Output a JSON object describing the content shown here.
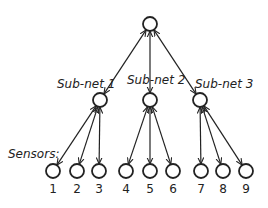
{
  "diagram": {
    "root": {
      "x": 150,
      "y": 24
    },
    "subnets": [
      {
        "label": "Sub-net 1",
        "x": 100,
        "y": 100,
        "lx": 57,
        "ly": 77
      },
      {
        "label": "Sub-net 2",
        "x": 150,
        "y": 100,
        "lx": 127,
        "ly": 73
      },
      {
        "label": "Sub-net 3",
        "x": 200,
        "y": 100,
        "lx": 195,
        "ly": 77
      }
    ],
    "sensors_label": "Sensors:",
    "sensors": [
      {
        "label": "1",
        "x": 53,
        "y": 171,
        "parent": 0
      },
      {
        "label": "2",
        "x": 77,
        "y": 171,
        "parent": 0
      },
      {
        "label": "3",
        "x": 99,
        "y": 171,
        "parent": 0
      },
      {
        "label": "4",
        "x": 126,
        "y": 171,
        "parent": 1
      },
      {
        "label": "5",
        "x": 150,
        "y": 171,
        "parent": 1
      },
      {
        "label": "6",
        "x": 173,
        "y": 171,
        "parent": 1
      },
      {
        "label": "7",
        "x": 201,
        "y": 171,
        "parent": 2
      },
      {
        "label": "8",
        "x": 223,
        "y": 171,
        "parent": 2
      },
      {
        "label": "9",
        "x": 246,
        "y": 171,
        "parent": 2
      }
    ],
    "node_radius": 7,
    "line_color": "#222222"
  }
}
